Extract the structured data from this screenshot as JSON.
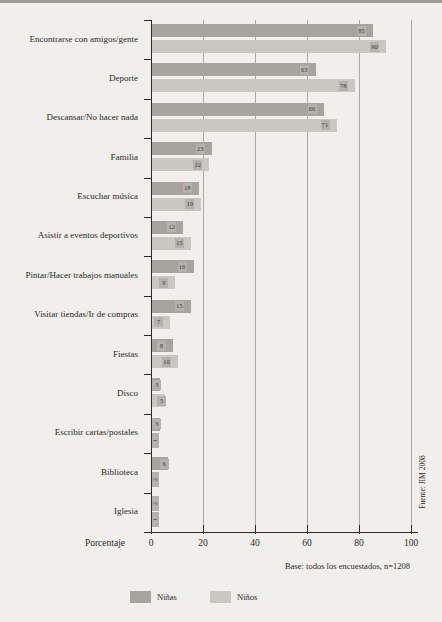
{
  "chart_data": {
    "type": "bar",
    "orientation": "horizontal",
    "title": "",
    "xlabel": "Porcentaje",
    "xlim": [
      0,
      100
    ],
    "xticks": [
      0,
      20,
      40,
      60,
      80,
      100
    ],
    "grid": true,
    "legend_position": "bottom",
    "categories": [
      "Encontrarse con amigos/gente",
      "Deporte",
      "Descansar/No hacer nada",
      "Familia",
      "Escuchar música",
      "Asistir a eventos deportivos",
      "Pintar/Hacer trabajos manuales",
      "Visitar tiendas/Ir de compras",
      "Fiestas",
      "Disco",
      "Escribir cartas/postales",
      "Biblioteca",
      "Iglesia"
    ],
    "series": [
      {
        "name": "Niñas",
        "color": "#a7a4a0",
        "values": [
          85,
          63,
          66,
          23,
          18,
          12,
          16,
          15,
          8,
          3,
          3,
          6,
          2
        ]
      },
      {
        "name": "Niños",
        "color": "#c9c7c2",
        "values": [
          90,
          78,
          71,
          22,
          19,
          15,
          9,
          7,
          10,
          5,
          1,
          2,
          1
        ]
      }
    ],
    "note": "Base: todos los encuestados, n=1208",
    "source": "Fuente: JIM 2008"
  },
  "colors": {
    "background": "#f0efec",
    "gridline": "#aaa9a6",
    "axis": "#2a2a28",
    "ninas_bar": "#a7a4a0",
    "ninos_bar": "#c9c7c2",
    "value_chip": "#b4b2ae"
  }
}
